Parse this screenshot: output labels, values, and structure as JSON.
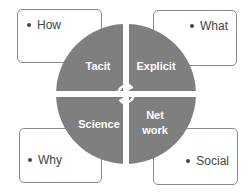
{
  "outer_boxes": {
    "top_left": "How",
    "top_right": "What",
    "bottom_left": "Why",
    "bottom_right": "Social"
  },
  "quadrants": {
    "top_left": "Tacit",
    "top_right": "Explicit",
    "bottom_left": "Science",
    "bottom_right_line1": "Net",
    "bottom_right_line2": "work"
  },
  "center_icon": "cycle-arrows-icon",
  "colors": {
    "quadrant_fill": "#7f7f7f",
    "box_border": "#8a8a8a",
    "text": "#444444"
  }
}
